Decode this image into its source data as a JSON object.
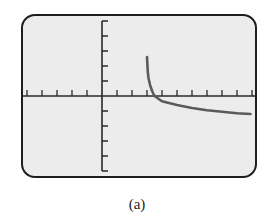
{
  "caption": "(a)",
  "colors": {
    "screen_bg": "#ececec",
    "frame": "#1e1e1e",
    "axis": "#2a2a2a",
    "curve": "#5a5a5a"
  },
  "chart_data": {
    "type": "line",
    "title": "",
    "xlabel": "",
    "ylabel": "",
    "xlim": [
      -5,
      10
    ],
    "ylim": [
      -5,
      5
    ],
    "x_tick_step": 1,
    "y_tick_step": 1,
    "grid": false,
    "legend": null,
    "vertical_asymptote": 3,
    "series": [
      {
        "name": "curve",
        "x": [
          3.0,
          3.05,
          3.1,
          3.2,
          3.35,
          3.5,
          4.0,
          5.0,
          6.0,
          7.0,
          8.0,
          9.0,
          9.9
        ],
        "y": [
          2.6,
          1.6,
          1.2,
          0.75,
          0.3,
          0.0,
          -0.35,
          -0.6,
          -0.8,
          -0.95,
          -1.05,
          -1.15,
          -1.2
        ]
      }
    ]
  }
}
